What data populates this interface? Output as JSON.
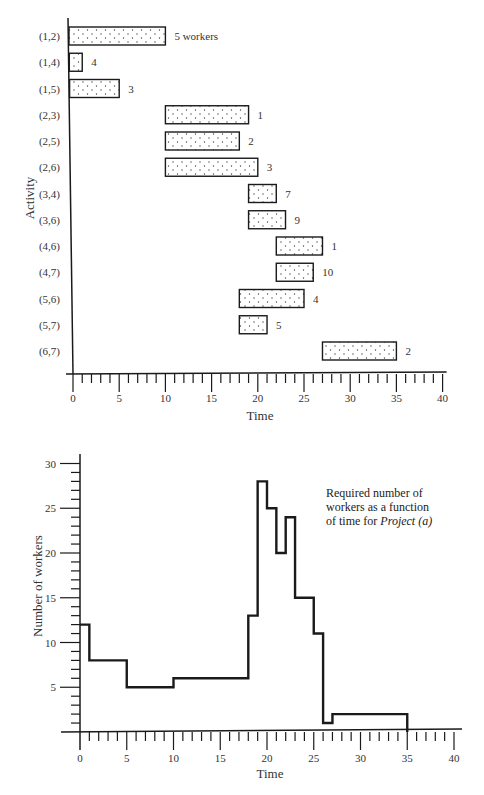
{
  "chart_data": [
    {
      "type": "gantt",
      "title": "",
      "xlabel": "Time",
      "ylabel": "Activity",
      "xlim": [
        0,
        40
      ],
      "xticks": [
        0,
        5,
        10,
        15,
        20,
        25,
        30,
        35,
        40
      ],
      "minor_tick_step": 1,
      "grid": false,
      "bar_fill": "dotted",
      "tasks": [
        {
          "activity": "(1,2)",
          "start": 0,
          "end": 10,
          "workers": 5,
          "label": "5 workers"
        },
        {
          "activity": "(1,4)",
          "start": 0,
          "end": 1,
          "workers": 4,
          "label": "4"
        },
        {
          "activity": "(1,5)",
          "start": 0,
          "end": 5,
          "workers": 3,
          "label": "3"
        },
        {
          "activity": "(2,3)",
          "start": 10,
          "end": 19,
          "workers": 1,
          "label": "1"
        },
        {
          "activity": "(2,5)",
          "start": 10,
          "end": 18,
          "workers": 2,
          "label": "2"
        },
        {
          "activity": "(2,6)",
          "start": 10,
          "end": 20,
          "workers": 3,
          "label": "3"
        },
        {
          "activity": "(3,4)",
          "start": 19,
          "end": 22,
          "workers": 7,
          "label": "7"
        },
        {
          "activity": "(3,6)",
          "start": 19,
          "end": 23,
          "workers": 9,
          "label": "9"
        },
        {
          "activity": "(4,6)",
          "start": 22,
          "end": 27,
          "workers": 1,
          "label": "1"
        },
        {
          "activity": "(4,7)",
          "start": 22,
          "end": 26,
          "workers": 10,
          "label": "10"
        },
        {
          "activity": "(5,6)",
          "start": 18,
          "end": 25,
          "workers": 4,
          "label": "4"
        },
        {
          "activity": "(5,7)",
          "start": 18,
          "end": 21,
          "workers": 5,
          "label": "5"
        },
        {
          "activity": "(6,7)",
          "start": 27,
          "end": 35,
          "workers": 2,
          "label": "2"
        }
      ]
    },
    {
      "type": "line",
      "subtype": "step",
      "title": "",
      "xlabel": "Time",
      "ylabel": "Number of workers",
      "xlim": [
        0,
        40
      ],
      "ylim": [
        0,
        30
      ],
      "xticks": [
        0,
        5,
        10,
        15,
        20,
        25,
        30,
        35,
        40
      ],
      "yticks": [
        5,
        10,
        15,
        20,
        25,
        30
      ],
      "minor_tick_step": 1,
      "grid": false,
      "annotation": {
        "text": "Required number of workers as a function of time for",
        "italic_text": "Project (a)"
      },
      "series": [
        {
          "name": "Required workers",
          "steps": [
            {
              "from": 0,
              "to": 1,
              "value": 12
            },
            {
              "from": 1,
              "to": 5,
              "value": 8
            },
            {
              "from": 5,
              "to": 10,
              "value": 5
            },
            {
              "from": 10,
              "to": 18,
              "value": 6
            },
            {
              "from": 18,
              "to": 19,
              "value": 13
            },
            {
              "from": 19,
              "to": 20,
              "value": 28
            },
            {
              "from": 20,
              "to": 21,
              "value": 25
            },
            {
              "from": 21,
              "to": 22,
              "value": 20
            },
            {
              "from": 22,
              "to": 23,
              "value": 24
            },
            {
              "from": 23,
              "to": 25,
              "value": 15
            },
            {
              "from": 25,
              "to": 26,
              "value": 11
            },
            {
              "from": 26,
              "to": 27,
              "value": 1
            },
            {
              "from": 27,
              "to": 35,
              "value": 2
            }
          ]
        }
      ]
    }
  ],
  "labels": {
    "top_ylabel": "Activity",
    "top_xlabel": "Time",
    "bottom_ylabel": "Number of workers",
    "bottom_xlabel": "Time",
    "note_line1": "Required number of",
    "note_line2": "workers as a function",
    "note_line3": "of time for",
    "note_italic": "Project (a)"
  },
  "colors": {
    "ink": "#1a1a1a",
    "text": "#333333",
    "bar_fill": "#ffffff",
    "dots": "#444444"
  }
}
